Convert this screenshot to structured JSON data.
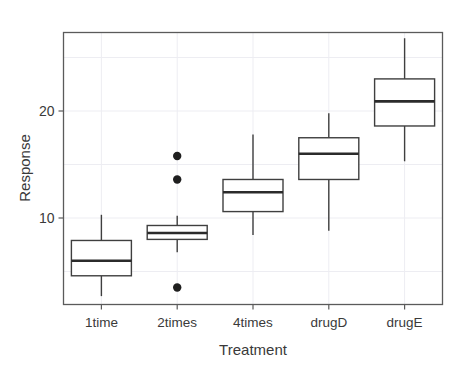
{
  "chart_data": {
    "type": "box",
    "title": "",
    "xlabel": "Treatment",
    "ylabel": "Response",
    "categories": [
      "1time",
      "2times",
      "4times",
      "drugD",
      "drugE"
    ],
    "ytick_labels": [
      "10",
      "20"
    ],
    "yticks": [
      10,
      20
    ],
    "ylim": [
      1.5,
      28.5
    ],
    "grid": true,
    "legend": "none",
    "box_color": "#3f3f3f",
    "median_color": "#2b2b2b",
    "outlier_color": "#1f1f1f",
    "panel_color": "#5a5a5a",
    "grid_color": "#ededf2",
    "background": "#ffffff",
    "boxes": [
      {
        "category": "1time",
        "whisker_low": 2.7,
        "q1": 4.6,
        "median": 6.0,
        "q3": 7.9,
        "whisker_high": 10.3,
        "outliers": []
      },
      {
        "category": "2times",
        "whisker_low": 6.8,
        "q1": 8.0,
        "median": 8.6,
        "q3": 9.3,
        "whisker_high": 10.2,
        "outliers": [
          15.8,
          13.6,
          3.5
        ]
      },
      {
        "category": "4times",
        "whisker_low": 8.4,
        "q1": 10.6,
        "median": 12.4,
        "q3": 13.6,
        "whisker_high": 17.8,
        "outliers": []
      },
      {
        "category": "drugD",
        "whisker_low": 8.8,
        "q1": 13.6,
        "median": 16.0,
        "q3": 17.5,
        "whisker_high": 19.8,
        "outliers": []
      },
      {
        "category": "drugE",
        "whisker_low": 15.3,
        "q1": 18.6,
        "median": 20.9,
        "q3": 23.0,
        "whisker_high": 26.8,
        "outliers": []
      }
    ]
  },
  "axis": {
    "y_title": "Response",
    "x_title": "Treatment"
  }
}
